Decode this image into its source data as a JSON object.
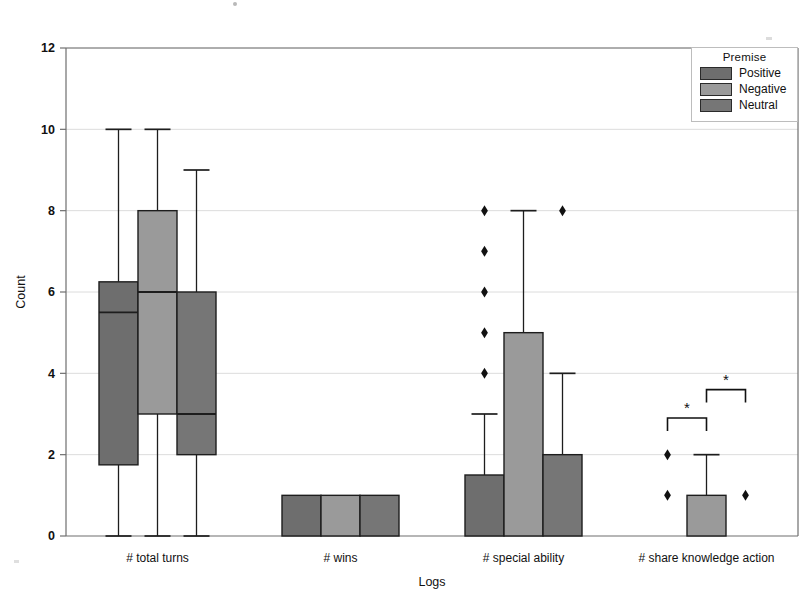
{
  "chart_data": {
    "type": "box",
    "title": "",
    "xlabel": "Logs",
    "ylabel": "Count",
    "ylim": [
      0,
      12
    ],
    "yticks": [
      0,
      2,
      4,
      6,
      8,
      10,
      12
    ],
    "grid": true,
    "legend_position": "top-right",
    "legend_title": "Premise",
    "categories": [
      "# total turns",
      "# wins",
      "# special ability",
      "# share knowledge action"
    ],
    "series": [
      {
        "name": "Positive",
        "color": "#6e6e6e",
        "boxes": [
          {
            "category": "# total turns",
            "whisker_low": 0,
            "q1": 1.75,
            "median": 5.5,
            "q3": 6.25,
            "whisker_high": 10,
            "outliers": []
          },
          {
            "category": "# wins",
            "whisker_low": 0,
            "q1": 0,
            "median": 0,
            "q3": 1,
            "whisker_high": 1,
            "outliers": []
          },
          {
            "category": "# special ability",
            "whisker_low": 0,
            "q1": 0,
            "median": 0,
            "q3": 1.5,
            "whisker_high": 3,
            "outliers": [
              4,
              5,
              6,
              7,
              8
            ]
          },
          {
            "category": "# share knowledge action",
            "whisker_low": 0,
            "q1": 0,
            "median": 0,
            "q3": 0,
            "whisker_high": 0,
            "outliers": [
              1,
              2
            ]
          }
        ]
      },
      {
        "name": "Negative",
        "color": "#9a9a9a",
        "boxes": [
          {
            "category": "# total turns",
            "whisker_low": 0,
            "q1": 3,
            "median": 6,
            "q3": 8,
            "whisker_high": 10,
            "outliers": []
          },
          {
            "category": "# wins",
            "whisker_low": 0,
            "q1": 0,
            "median": 0,
            "q3": 1,
            "whisker_high": 1,
            "outliers": []
          },
          {
            "category": "# special ability",
            "whisker_low": 0,
            "q1": 0,
            "median": 0,
            "q3": 5,
            "whisker_high": 8,
            "outliers": []
          },
          {
            "category": "# share knowledge action",
            "whisker_low": 0,
            "q1": 0,
            "median": 0,
            "q3": 1,
            "whisker_high": 2,
            "outliers": []
          }
        ]
      },
      {
        "name": "Neutral",
        "color": "#767676",
        "boxes": [
          {
            "category": "# total turns",
            "whisker_low": 0,
            "q1": 2,
            "median": 3,
            "q3": 6,
            "whisker_high": 9,
            "outliers": []
          },
          {
            "category": "# wins",
            "whisker_low": 0,
            "q1": 0,
            "median": 0,
            "q3": 1,
            "whisker_high": 1,
            "outliers": []
          },
          {
            "category": "# special ability",
            "whisker_low": 0,
            "q1": 0,
            "median": 0,
            "q3": 2,
            "whisker_high": 4,
            "outliers": [
              8
            ]
          },
          {
            "category": "# share knowledge action",
            "whisker_low": 0,
            "q1": 0,
            "median": 0,
            "q3": 0,
            "whisker_high": 0,
            "outliers": [
              1
            ]
          }
        ]
      }
    ],
    "annotations": [
      {
        "type": "significance-bracket",
        "label": "*",
        "category": "# share knowledge action",
        "from_series": "Positive",
        "to_series": "Negative",
        "y": 2.9
      },
      {
        "type": "significance-bracket",
        "label": "*",
        "category": "# share knowledge action",
        "from_series": "Negative",
        "to_series": "Neutral",
        "y": 3.6
      }
    ]
  },
  "legend": {
    "title": "Premise",
    "entries": [
      {
        "label": "Positive",
        "color": "#6e6e6e"
      },
      {
        "label": "Negative",
        "color": "#9a9a9a"
      },
      {
        "label": "Neutral",
        "color": "#767676"
      }
    ]
  },
  "axes": {
    "y_title": "Count",
    "x_title": "Logs",
    "y_tick_labels": [
      "0",
      "2",
      "4",
      "6",
      "8",
      "10",
      "12"
    ],
    "x_tick_labels": [
      "# total turns",
      "# wins",
      "# special ability",
      "# share knowledge action"
    ]
  }
}
